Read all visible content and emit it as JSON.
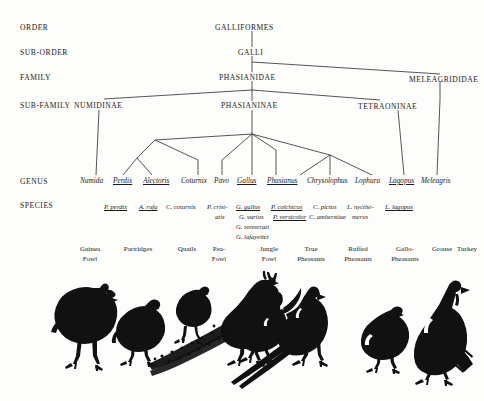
{
  "diagram": {
    "ranks": [
      {
        "key": "order",
        "label": "ORDER"
      },
      {
        "key": "sub_order",
        "label": "SUB-ORDER"
      },
      {
        "key": "family",
        "label": "FAMILY"
      },
      {
        "key": "sub_family",
        "label": "SUB-FAMILY"
      },
      {
        "key": "genus",
        "label": "GENUS"
      },
      {
        "key": "species",
        "label": "SPECIES"
      }
    ],
    "order_node": "GALLIFORMES",
    "sub_order_node": "GALLI",
    "families": [
      "PHASIANIDAE",
      "MELEAGRIDIDAE"
    ],
    "sub_families": [
      "NUMIDINAE",
      "PHASIANINAE",
      "TETRAONINAE"
    ],
    "genera": [
      {
        "name": "Numida",
        "underlined": false
      },
      {
        "name": "Perdix",
        "underlined": true
      },
      {
        "name": "Alectoris",
        "underlined": true
      },
      {
        "name": "Coturnix",
        "underlined": false
      },
      {
        "name": "Pavo",
        "underlined": false
      },
      {
        "name": "Gallus",
        "underlined": true
      },
      {
        "name": "Phasianus",
        "underlined": true
      },
      {
        "name": "Chrysolophus",
        "underlined": false
      },
      {
        "name": "Lophura",
        "underlined": false
      },
      {
        "name": "Lagopus",
        "underlined": true
      },
      {
        "name": "Meleagris",
        "underlined": false
      }
    ],
    "species": [
      {
        "name": "P. perdix",
        "underlined": true
      },
      {
        "name": "A. rufa",
        "underlined": true
      },
      {
        "name": "C. coturnix",
        "underlined": false
      },
      {
        "name": "P. crist-",
        "underlined": false
      },
      {
        "name": "atis",
        "underlined": false
      },
      {
        "name": "G. gallus",
        "underlined": true
      },
      {
        "name": "G. varius",
        "underlined": false
      },
      {
        "name": "G. sonnerati",
        "underlined": false
      },
      {
        "name": "G. lafayettei",
        "underlined": false
      },
      {
        "name": "P. colchicus",
        "underlined": true
      },
      {
        "name": "P. versicolor",
        "underlined": true
      },
      {
        "name": "C. pictus",
        "underlined": false
      },
      {
        "name": "C. amherstiae",
        "underlined": false
      },
      {
        "name": "L. nycthe-",
        "underlined": false
      },
      {
        "name": "merus",
        "underlined": false
      },
      {
        "name": "L. lagopus",
        "underlined": true
      }
    ],
    "common_names": [
      {
        "line1": "Guinea",
        "line2": "Fowl"
      },
      {
        "line1": "Partridges",
        "line2": ""
      },
      {
        "line1": "Quails",
        "line2": ""
      },
      {
        "line1": "Pea-",
        "line2": "Fowl"
      },
      {
        "line1": "Jungle",
        "line2": "Fowl"
      },
      {
        "line1": "True",
        "line2": "Pheasants"
      },
      {
        "line1": "Ruffed",
        "line2": "Pheasants"
      },
      {
        "line1": "Gallo-",
        "line2": "Pheasants"
      },
      {
        "line1": "Grouse",
        "line2": ""
      },
      {
        "line1": "Turkey",
        "line2": ""
      }
    ],
    "birds": [
      "guinea-fowl",
      "partridge",
      "quail",
      "peafowl",
      "jungle-fowl-rooster",
      "pheasant",
      "grouse",
      "turkey"
    ],
    "colors": {
      "ink": "#1a1a1a",
      "line": "#2b2b2b",
      "paper": "#fdfdfb"
    }
  }
}
